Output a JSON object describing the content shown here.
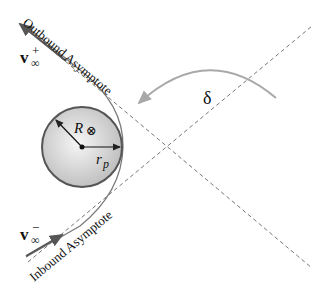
{
  "diagram": {
    "labels": {
      "outbound_asymptote": "Outbound Asymptote",
      "inbound_asymptote": "Inbound Asymptote",
      "v_out": "v",
      "v_out_sub": "∞",
      "v_out_sup": "+",
      "v_in": "v",
      "v_in_sub": "∞",
      "v_in_sup": "−",
      "turn_angle": "δ",
      "planet_radius": "R",
      "planet_radius_sub": "⊗",
      "periapsis_radius": "r",
      "periapsis_radius_sub": "p"
    },
    "colors": {
      "trajectory": "#7a7a7a",
      "asymptote": "#777777",
      "arc": "#a8a8a8",
      "planet_fill_center": "#f4f4f4",
      "planet_fill_edge": "#bdbdbd",
      "planet_stroke": "#555555",
      "text": "#111111"
    }
  }
}
